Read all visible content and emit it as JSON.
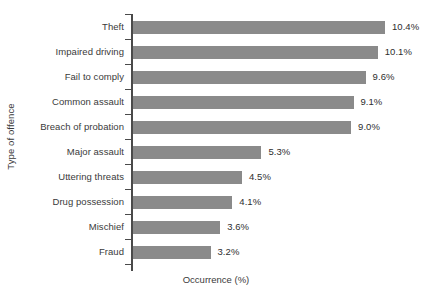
{
  "chart_data": {
    "type": "bar",
    "orientation": "horizontal",
    "title": "",
    "xlabel": "Occurrence (%)",
    "ylabel": "Type of offence",
    "categories": [
      "Theft",
      "Impaired driving",
      "Fail to comply",
      "Common assault",
      "Breach of probation",
      "Major assault",
      "Uttering threats",
      "Drug possession",
      "Mischief",
      "Fraud"
    ],
    "values": [
      10.4,
      10.1,
      9.6,
      9.1,
      9.0,
      5.3,
      4.5,
      4.1,
      3.6,
      3.2
    ],
    "value_labels": [
      "10.4%",
      "10.1%",
      "9.6%",
      "9.1%",
      "9.0%",
      "5.3%",
      "4.5%",
      "4.1%",
      "3.6%",
      "3.2%"
    ],
    "xlim": [
      0,
      10.4
    ],
    "xtick_labels": [],
    "grid": false,
    "legend": false,
    "bar_color": "#8a8a8a",
    "axis_color": "#4a4a4a",
    "text_color": "#3a3a3a",
    "background_color": "#ffffff"
  }
}
